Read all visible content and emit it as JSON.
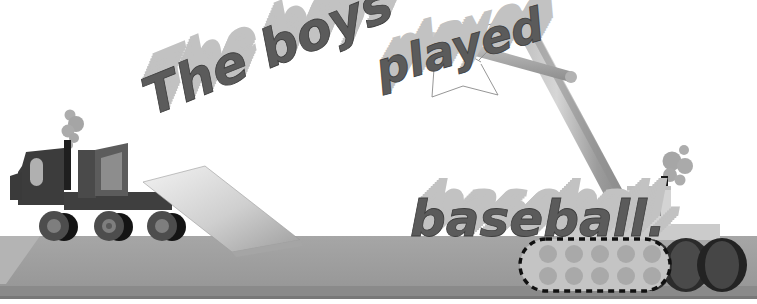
{
  "scene": {
    "title": "The boys played baseball.",
    "background_color": "#ffffff",
    "width": 757,
    "height": 304
  },
  "colors": {
    "ground_top": "#9d9d9d",
    "ground_front": "#8a8a8a",
    "ground_bevel": "#b4b4b4",
    "truck_body_dark": "#3d3d3d",
    "truck_body_mid": "#5a5a5a",
    "truck_glass": "#b6b6b6",
    "wheel_tire_dark": "#1c1c1c",
    "wheel_hub": "#6e6e6e",
    "smoke": "#a8a8a8",
    "word_face": "#5e5e5e",
    "word_top": "#c6c6c6",
    "word_side": "#9a9a9a",
    "ramp_light": "#e2e2e2",
    "ramp_mid": "#bdbdbd",
    "crane_boom_light": "#c9c9c9",
    "crane_boom_mid": "#9e9e9e",
    "crane_boom_dark": "#7c7c7c",
    "crane_base": "#cccccc",
    "crane_cab": "#d2d2d2",
    "crane_window": "#808080",
    "track_fill": "#c3c3c3",
    "track_roller": "#a9a9a9",
    "track_outline": "#111111",
    "track_rear_dark": "#2a2a2a",
    "cable": "#7a7a7a",
    "stack_dark": "#1a1a1a"
  },
  "words": [
    {
      "id": "word-the-boys",
      "text": "The boys",
      "carried_by": "flatbed-truck",
      "rotation_deg": -22,
      "x": 152,
      "y": 116,
      "font_size": 52
    },
    {
      "id": "word-played",
      "text": "played",
      "carried_by": "crane-cables",
      "rotation_deg": -16,
      "x": 381,
      "y": 86,
      "font_size": 46
    },
    {
      "id": "word-baseball",
      "text": "baseball.",
      "carried_by": "ground",
      "rotation_deg": 0,
      "x": 410,
      "y": 178,
      "font_size": 50
    }
  ],
  "vehicles": [
    {
      "id": "flatbed-truck",
      "name": "flatbed truck",
      "wheel_count": 3,
      "has_smokestack": true,
      "cargo": "The boys"
    },
    {
      "id": "crawler-crane",
      "name": "crawler crane",
      "has_smokestack": true,
      "boom": "lattice boom",
      "jib": "horizontal jib",
      "cargo": "played",
      "track_roller_count": 10
    }
  ],
  "ground": {
    "label": "ground slab",
    "top_y": 232,
    "front_y": 286
  }
}
